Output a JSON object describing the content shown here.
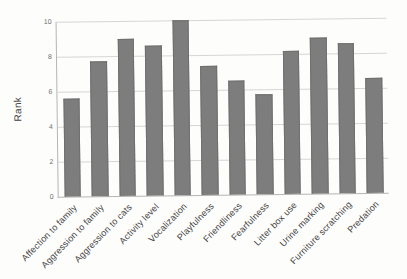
{
  "chart_data": {
    "type": "bar",
    "title": "",
    "xlabel": "",
    "ylabel": "Rank",
    "ylim": [
      0,
      10
    ],
    "yticks": [
      0,
      2,
      4,
      6,
      8,
      10
    ],
    "grid": true,
    "legend": "none",
    "categories": [
      "Affection to family",
      "Aggression to family",
      "Aggression to cats",
      "Activity level",
      "Vocalization",
      "Playfulness",
      "Friendliness",
      "Fearfulness",
      "Litter box use",
      "Urine marking",
      "Furniture scratching",
      "Predation"
    ],
    "values": [
      5.6,
      7.7,
      9.0,
      8.6,
      10.0,
      7.4,
      6.5,
      5.7,
      8.2,
      8.9,
      8.6,
      6.6
    ],
    "bar_color": "#7d7d7d",
    "bar_edge_color": "#6f6f6f",
    "gridline_color": "#d6d6d6",
    "axis_color": "#b5b5b5",
    "tick_label_color": "#6e6e6e",
    "category_label_color": "#3f3f3f",
    "background_color": "#fdfdfc"
  }
}
